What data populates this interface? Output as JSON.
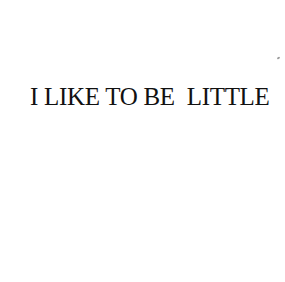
{
  "headline": {
    "text": "I LIKE TO BE  LITTLE"
  },
  "colors": {
    "background": "#ffffff",
    "text": "#111111"
  }
}
